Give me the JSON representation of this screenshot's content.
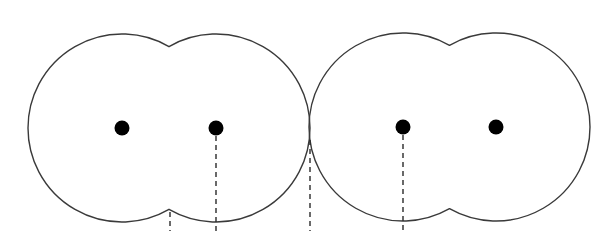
{
  "diagram": {
    "colors": {
      "background": "#ffffff",
      "stroke": "#3a3a3a",
      "dot": "#000000",
      "dash": "#2a2a2a"
    },
    "radius": 94,
    "dot_radius": 7.5,
    "groups": [
      {
        "id": "left-pair",
        "centers": [
          [
            122,
            128
          ],
          [
            216,
            128
          ]
        ]
      },
      {
        "id": "right-pair",
        "centers": [
          [
            403,
            127
          ],
          [
            496,
            127
          ]
        ]
      }
    ],
    "dashed_lines": [
      {
        "id": "left-notch-guide",
        "x": 170,
        "y1": 212,
        "y2": 231
      },
      {
        "id": "left-center2-guide",
        "x": 216,
        "y1": 136,
        "y2": 231
      },
      {
        "id": "touch-point-guide",
        "x": 310,
        "y1": 140,
        "y2": 231
      },
      {
        "id": "right-center1-guide",
        "x": 403,
        "y1": 135,
        "y2": 231
      }
    ]
  }
}
